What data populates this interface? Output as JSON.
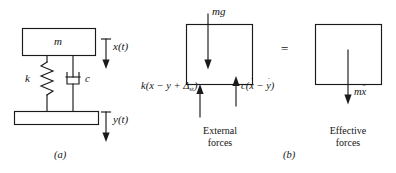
{
  "figure": {
    "caption_a": "(a)",
    "caption_b": "(b)"
  },
  "panel_a": {
    "mass_label": "m",
    "spring_label": "k",
    "damper_label": "c",
    "mass_displacement_label": "x(t)",
    "base_displacement_label": "y(t)"
  },
  "panel_b": {
    "equals_sign": "=",
    "external": {
      "group_caption_line1": "External",
      "group_caption_line2": "forces",
      "gravity_force": "mg",
      "spring_force_prefix": "k(x − y + Δ",
      "spring_force_subscript": "st",
      "spring_force_suffix": ")",
      "damper_force_prefix": "c(",
      "damper_force_var1": "x",
      "damper_force_minus": " − ",
      "damper_force_var2": "y",
      "damper_force_suffix": ")",
      "damper_dot1": "˙",
      "damper_dot2": "˙"
    },
    "effective": {
      "group_caption_line1": "Effective",
      "group_caption_line2": "forces",
      "inertia_force_mass": "m",
      "inertia_force_var": "x",
      "inertia_force_accent": "¨"
    }
  },
  "colors": {
    "stroke": "#1a1a1a",
    "text": "#141414",
    "background": "#ffffff"
  }
}
